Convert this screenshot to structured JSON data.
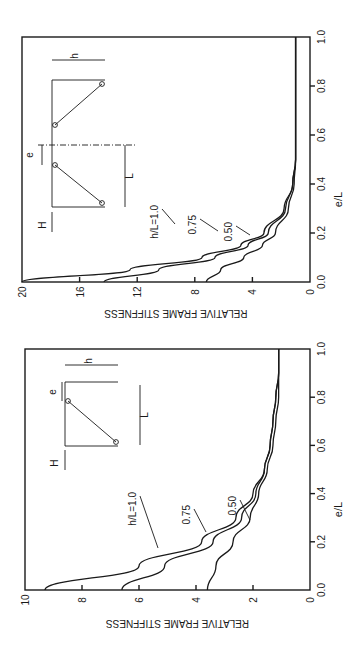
{
  "chart_data": [
    {
      "type": "line",
      "title": "",
      "panel": "upper",
      "xlabel": "e/L",
      "ylabel": "RELATIVE FRAME STIFFNESS",
      "xlim": [
        0.0,
        1.0
      ],
      "ylim": [
        0,
        20
      ],
      "xticks": [
        "0.0",
        "0.2",
        "0.4",
        "0.6",
        "0.8",
        "1.0"
      ],
      "yticks": [
        "0",
        "4",
        "8",
        "12",
        "16",
        "20"
      ],
      "grid": false,
      "x": [
        0.0,
        0.05,
        0.1,
        0.15,
        0.2,
        0.3,
        0.4,
        0.5,
        0.6,
        0.8,
        1.0
      ],
      "series": [
        {
          "name": "h/L=1.0",
          "values": [
            20.0,
            12.5,
            7.5,
            4.8,
            3.2,
            1.8,
            1.2,
            1.0,
            1.0,
            1.0,
            1.0
          ]
        },
        {
          "name": "0.75",
          "values": [
            14.3,
            10.5,
            6.6,
            4.3,
            2.9,
            1.7,
            1.2,
            1.0,
            1.0,
            1.0,
            1.0
          ]
        },
        {
          "name": "0.50",
          "values": [
            7.2,
            6.2,
            4.6,
            3.3,
            2.4,
            1.5,
            1.1,
            1.0,
            1.0,
            1.0,
            1.0
          ]
        }
      ],
      "annotations": [
        "h/L=1.0",
        "0.75",
        "0.50",
        "H",
        "e",
        "L",
        "h"
      ]
    },
    {
      "type": "line",
      "title": "",
      "panel": "lower",
      "xlabel": "e/L",
      "ylabel": "RELATIVE FRAME STIFFNESS",
      "xlim": [
        0.0,
        1.0
      ],
      "ylim": [
        0,
        10
      ],
      "xticks": [
        "0.0",
        "0.2",
        "0.4",
        "0.6",
        "0.8",
        "1.0"
      ],
      "yticks": [
        "0",
        "2",
        "4",
        "6",
        "8",
        "10"
      ],
      "grid": false,
      "x": [
        0.0,
        0.1,
        0.2,
        0.3,
        0.4,
        0.5,
        0.6,
        0.7,
        0.8,
        0.9,
        1.0
      ],
      "series": [
        {
          "name": "h/L=1.0",
          "values": [
            9.3,
            6.0,
            3.8,
            2.6,
            2.0,
            1.6,
            1.4,
            1.3,
            1.2,
            1.1,
            1.1
          ]
        },
        {
          "name": "0.75",
          "values": [
            6.6,
            5.1,
            3.4,
            2.4,
            1.9,
            1.6,
            1.4,
            1.3,
            1.2,
            1.1,
            1.1
          ]
        },
        {
          "name": "0.50",
          "values": [
            3.6,
            3.3,
            2.7,
            2.1,
            1.8,
            1.5,
            1.3,
            1.2,
            1.1,
            1.1,
            1.1
          ]
        }
      ],
      "annotations": [
        "h/L=1.0",
        "0.75",
        "0.50",
        "H",
        "e",
        "L",
        "h"
      ]
    }
  ],
  "labels": {
    "ylabel": "RELATIVE FRAME STIFFNESS",
    "xlabel": "e/L",
    "series_label_1": "h/L=1.0",
    "series_label_2": "0.75",
    "series_label_3": "0.50",
    "load": "H",
    "ecc": "e",
    "span": "L",
    "height": "h"
  }
}
